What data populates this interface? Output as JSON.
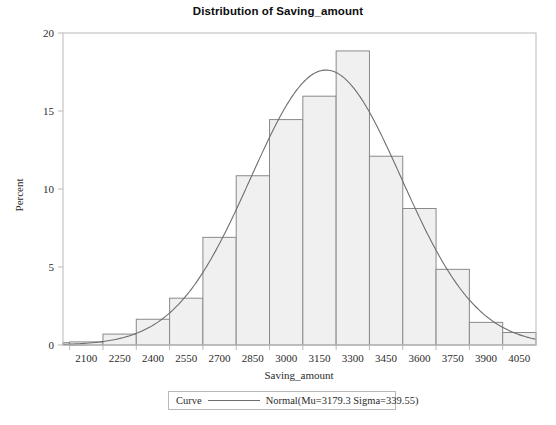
{
  "chart_data": {
    "type": "bar",
    "title": "Distribution of Saving_amount",
    "xlabel": "Saving_amount",
    "ylabel": "Percent",
    "grid": false,
    "xlim": [
      1995,
      4125
    ],
    "ylim": [
      0,
      20
    ],
    "yticks": [
      0,
      5,
      10,
      15,
      20
    ],
    "ytick_labels": [
      "0",
      "5",
      "10",
      "15",
      "20"
    ],
    "xticks": [
      2100,
      2250,
      2400,
      2550,
      2700,
      2850,
      3000,
      3150,
      3300,
      3450,
      3600,
      3750,
      3900,
      4050
    ],
    "xtick_labels": [
      "2100",
      "2250",
      "2400",
      "2550",
      "2700",
      "2850",
      "3000",
      "3150",
      "3300",
      "3450",
      "3600",
      "3750",
      "3900",
      "4050"
    ],
    "bin_width": 150,
    "categories": [
      2025,
      2100,
      2250,
      2400,
      2550,
      2700,
      2850,
      3000,
      3150,
      3300,
      3450,
      3600,
      3750,
      3900,
      4050
    ],
    "values": [
      0.15,
      0.2,
      0.7,
      1.65,
      3.0,
      6.9,
      10.85,
      14.45,
      15.95,
      18.85,
      12.1,
      8.75,
      4.85,
      1.45,
      0.8
    ],
    "series": [
      {
        "name": "Normal(Mu=3179.3 Sigma=339.55)",
        "type": "line",
        "mu": 3179.3,
        "sigma": 339.55,
        "scale_percent_per_bin": 150,
        "peak_percent": 17.5,
        "peak_x": 3179.3
      }
    ],
    "legend": {
      "position": "bottom",
      "key_label": "Curve",
      "entry_label": "Normal(Mu=3179.3 Sigma=339.55)"
    },
    "colors": {
      "bar_fill": "#f0f0f0",
      "bar_stroke": "#8a8a8a",
      "curve": "#6e6e6e",
      "axis": "#b9b9b9",
      "text": "#2b2b2b",
      "background": "#ffffff"
    }
  }
}
